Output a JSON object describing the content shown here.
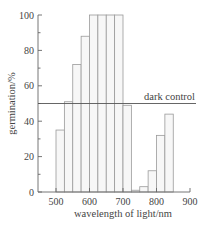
{
  "chart_data": {
    "type": "bar",
    "title": "",
    "xlabel": "wavelength of light/nm",
    "ylabel": "germination/%",
    "xlim": [
      500,
      900
    ],
    "ylim": [
      0,
      100
    ],
    "x_ticks": [
      500,
      600,
      700,
      800,
      900
    ],
    "y_ticks": [
      0,
      20,
      40,
      60,
      80,
      100
    ],
    "grid": false,
    "bin_width_nm": 25,
    "categories": [
      "500-525",
      "525-550",
      "550-575",
      "575-600",
      "600-625",
      "625-650",
      "650-675",
      "675-700",
      "700-725",
      "725-750",
      "750-775",
      "775-800",
      "800-825",
      "825-850"
    ],
    "bin_starts": [
      500,
      525,
      550,
      575,
      600,
      625,
      650,
      675,
      700,
      725,
      750,
      775,
      800,
      825
    ],
    "values": [
      35,
      51,
      72,
      88,
      100,
      100,
      100,
      100,
      49,
      1,
      3,
      12,
      32,
      44
    ],
    "reference_line": {
      "label": "dark control",
      "value": 50
    }
  }
}
